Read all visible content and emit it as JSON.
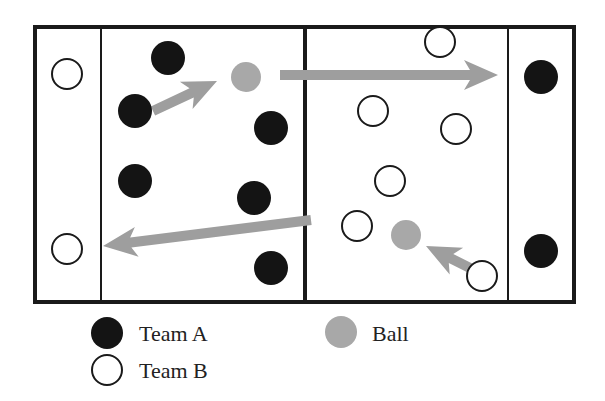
{
  "diagram": {
    "court": {
      "x": 35,
      "y": 27,
      "w": 539,
      "h": 275,
      "end_line_left_x": 101,
      "center_line_x": 305,
      "end_line_right_x": 508
    },
    "colors": {
      "team_a": "#141414",
      "team_b": "#ffffff",
      "ball": "#a8a8a8",
      "arrow": "#9e9e9e",
      "line": "#1a1a1a"
    },
    "team_a_players": [
      {
        "x": 168,
        "y": 58
      },
      {
        "x": 135,
        "y": 111
      },
      {
        "x": 271,
        "y": 128
      },
      {
        "x": 135,
        "y": 181
      },
      {
        "x": 254,
        "y": 198
      },
      {
        "x": 271,
        "y": 268
      },
      {
        "x": 541,
        "y": 77
      },
      {
        "x": 541,
        "y": 251
      }
    ],
    "team_b_players": [
      {
        "x": 67,
        "y": 74
      },
      {
        "x": 67,
        "y": 249
      },
      {
        "x": 440,
        "y": 42
      },
      {
        "x": 373,
        "y": 111
      },
      {
        "x": 456,
        "y": 129
      },
      {
        "x": 390,
        "y": 181
      },
      {
        "x": 357,
        "y": 226
      },
      {
        "x": 482,
        "y": 276
      }
    ],
    "balls": [
      {
        "x": 246,
        "y": 77
      },
      {
        "x": 406,
        "y": 235
      }
    ],
    "arrows": [
      {
        "x1": 153,
        "y1": 111,
        "x2": 217,
        "y2": 81
      },
      {
        "x1": 280,
        "y1": 75,
        "x2": 498,
        "y2": 75
      },
      {
        "x1": 311,
        "y1": 220,
        "x2": 103,
        "y2": 246
      },
      {
        "x1": 470,
        "y1": 268,
        "x2": 426,
        "y2": 246
      }
    ]
  },
  "legend": {
    "team_a": "Team A",
    "team_b": "Team B",
    "ball": "Ball"
  }
}
